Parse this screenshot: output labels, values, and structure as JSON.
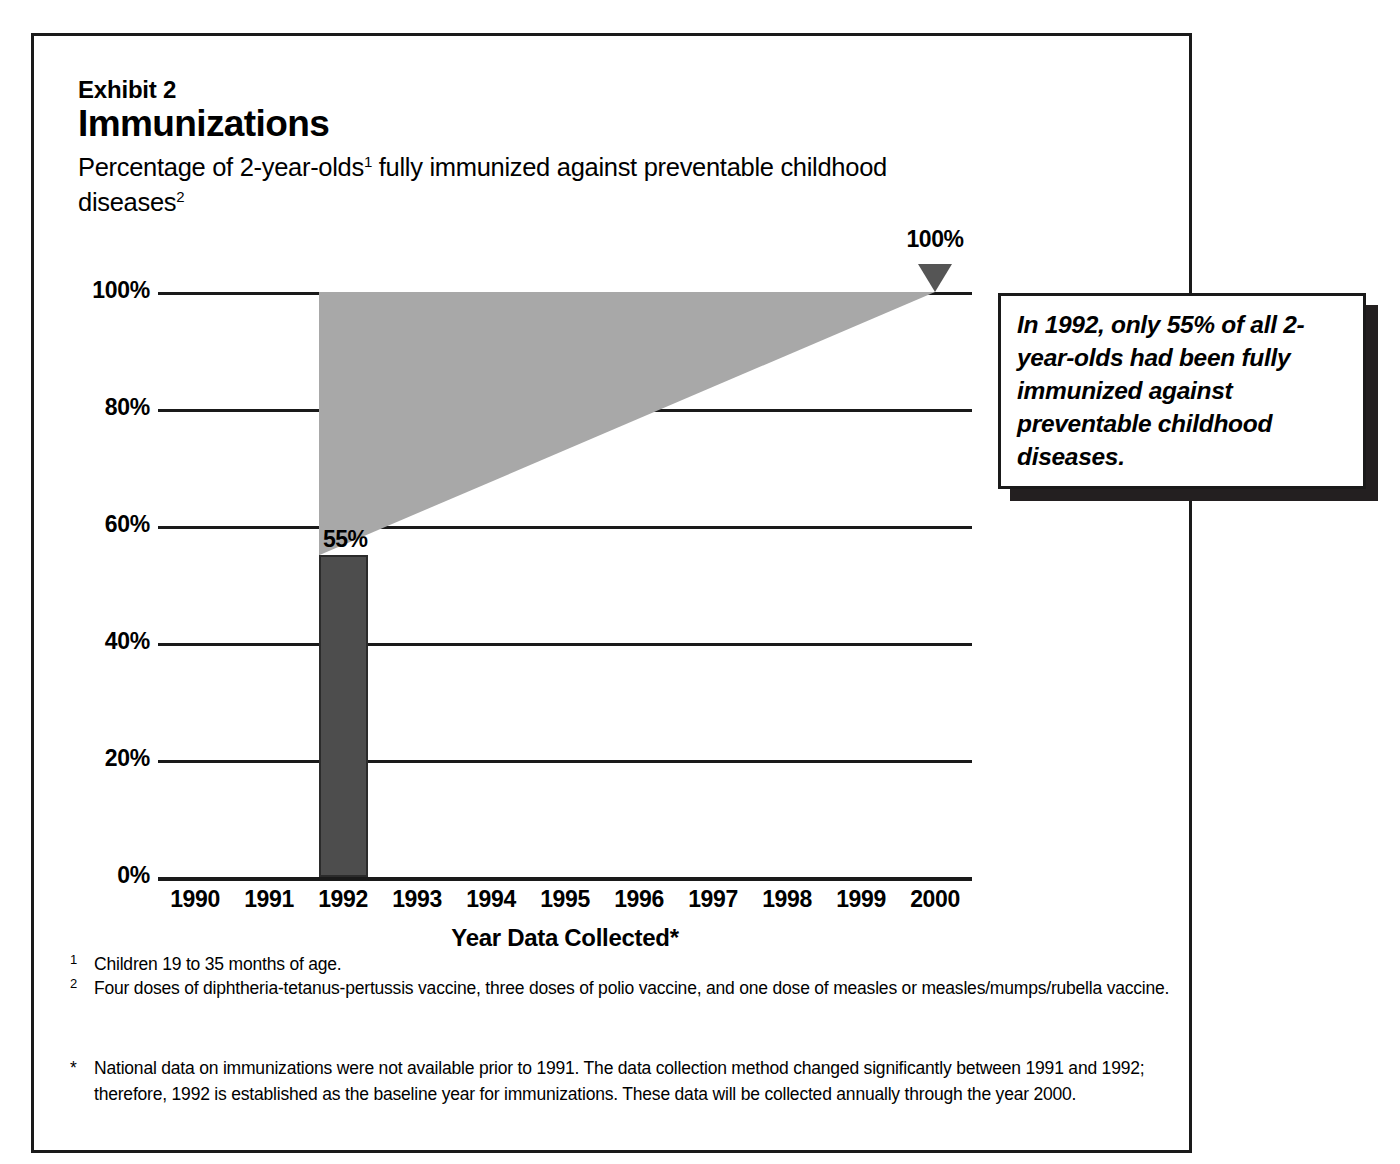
{
  "header": {
    "exhibit_label": "Exhibit 2",
    "title": "Immunizations",
    "subtitle_part1": "Percentage of 2-year-olds",
    "subtitle_sup1": "1",
    "subtitle_part2": " fully immunized against preventable childhood diseases",
    "subtitle_sup2": "2"
  },
  "callout": {
    "text": "In 1992, only 55% of all 2-year-olds had been fully immunized against preventable childhood diseases."
  },
  "footnotes": [
    {
      "marker": "1",
      "text": "Children 19 to 35 months of age."
    },
    {
      "marker": "2",
      "text": "Four doses of diphtheria-tetanus-pertussis vaccine, three doses of polio vaccine, and one dose of measles or measles/mumps/rubella vaccine."
    }
  ],
  "footnote_asterisk": {
    "marker": "*",
    "text": "National data on immunizations were not available prior to 1991.  The data collection method changed significantly between 1991 and 1992; therefore, 1992 is established as the baseline year for immunizations.  These data will be collected annually through the year 2000."
  },
  "colors": {
    "bar_fill": "#4d4d4d",
    "wedge_fill": "#a8a8a8",
    "marker_fill": "#555555",
    "line": "#1a1a1a",
    "shadow": "#231f20"
  },
  "chart_data": {
    "type": "bar",
    "title": "Immunizations",
    "subtitle": "Percentage of 2-year-olds fully immunized against preventable childhood diseases",
    "xlabel": "Year Data Collected*",
    "ylabel": "",
    "ylim": [
      0,
      100
    ],
    "ytick_labels": [
      "0%",
      "20%",
      "40%",
      "60%",
      "80%",
      "100%"
    ],
    "ytick_values": [
      0,
      20,
      40,
      60,
      80,
      100
    ],
    "grid": true,
    "legend": "none",
    "categories": [
      "1990",
      "1991",
      "1992",
      "1993",
      "1994",
      "1995",
      "1996",
      "1997",
      "1998",
      "1999",
      "2000"
    ],
    "values": [
      null,
      null,
      55,
      null,
      null,
      null,
      null,
      null,
      null,
      null,
      null
    ],
    "data_labels": [
      {
        "category": "1992",
        "value": 55,
        "label": "55%"
      }
    ],
    "annotations": [
      {
        "name": "target-marker",
        "category": "2000",
        "value": 100,
        "label": "100%",
        "shape": "down-triangle"
      },
      {
        "name": "projection-wedge",
        "description": "Shaded wedge from 55% at 1992 rising to 100% goal at 2000",
        "from": {
          "category": "1992",
          "value": 55
        },
        "to": {
          "category": "2000",
          "value": 100
        },
        "top_value": 100
      }
    ]
  }
}
